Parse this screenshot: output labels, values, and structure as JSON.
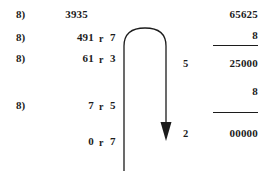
{
  "worksheet": {
    "title": "Repeated division by 8 with remainders, linked to multiplication column",
    "ink_color": "#1c1c1c",
    "background_color": "#ffffff"
  },
  "left_column": {
    "divisor_label": "8)",
    "remainder_symbol": "r",
    "rows": [
      {
        "label": "8)",
        "quotient": "3935",
        "remainder": "",
        "has_remainder": false
      },
      {
        "label": "8)",
        "quotient": "491",
        "remainder": "7",
        "has_remainder": true
      },
      {
        "label": "8)",
        "quotient": "61",
        "remainder": "3",
        "has_remainder": true
      },
      {
        "label": "8)",
        "quotient": "7",
        "remainder": "5",
        "has_remainder": true
      },
      {
        "label": "",
        "quotient": "0",
        "remainder": "7",
        "has_remainder": true
      }
    ]
  },
  "right_column": {
    "rows": [
      {
        "side": "",
        "value": "65625",
        "rule_below": false
      },
      {
        "side": "",
        "value": "8",
        "rule_below": true
      },
      {
        "side": "5",
        "value": "25000",
        "rule_below": false
      },
      {
        "side": "",
        "value": "8",
        "rule_below": true
      },
      {
        "side": "2",
        "value": "00000",
        "rule_below": false
      }
    ]
  },
  "arrow": {
    "name": "u-turn-arrow",
    "description": "inverted-U curve from lower-left stem up and over, pointing down at right",
    "color": "#1c1c1c",
    "stroke_width": "1.3"
  }
}
